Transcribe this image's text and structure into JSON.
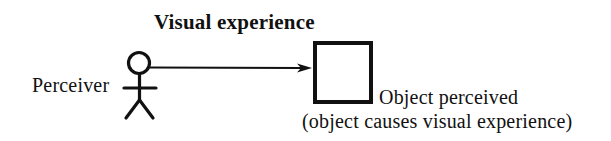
{
  "diagram": {
    "background_color": "#ffffff",
    "ink_color": "#111111",
    "labels": {
      "relation": "Visual experience",
      "subject": "Perceiver",
      "object": "Object perceived",
      "object_note": "(object causes visual experience)"
    },
    "shapes": {
      "stick_figure": {
        "name": "perceiver-stick-figure",
        "head_center_x": 139,
        "head_center_y": 63,
        "head_radius": 11,
        "body_top_y": 74,
        "body_bottom_y": 101,
        "arms_y": 88,
        "arms_left_x": 124,
        "arms_right_x": 156,
        "leg_left_x": 126,
        "leg_right_x": 153,
        "leg_bottom_y": 118,
        "stroke_width": 3
      },
      "object_box": {
        "name": "object-rectangle",
        "x": 313,
        "y": 41,
        "width": 59,
        "height": 62,
        "stroke_width": 4,
        "fill": "#ffffff"
      },
      "arrow": {
        "name": "visual-experience-arrow",
        "from_x": 150,
        "from_y": 67,
        "to_x": 312,
        "to_y": 68,
        "stroke_width": 2,
        "head_length": 13,
        "head_width": 9,
        "direction": "perceiver-to-object"
      }
    }
  }
}
